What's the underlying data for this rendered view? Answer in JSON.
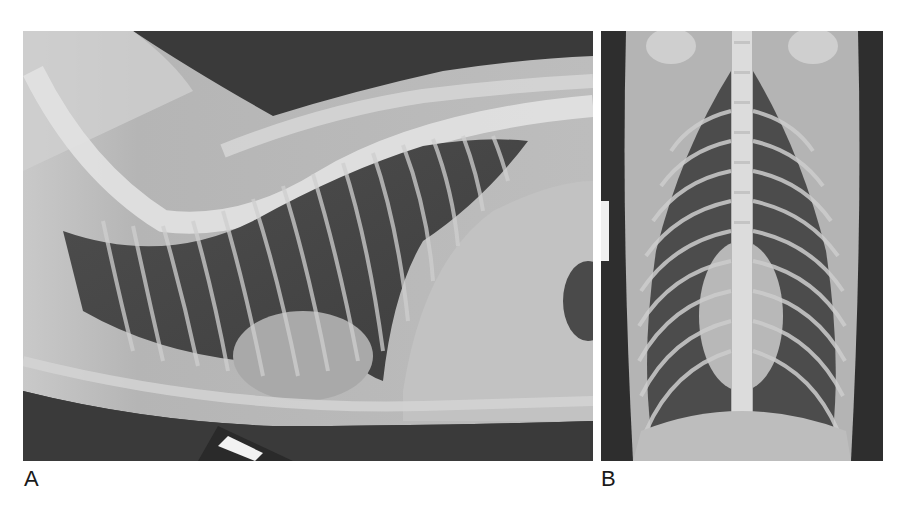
{
  "figure": {
    "panels": [
      {
        "label": "A",
        "view": "lateral thoracic radiograph",
        "description": "Lateral view of feline thorax showing spine, ribs, lungs and cardiac silhouette"
      },
      {
        "label": "B",
        "view": "ventrodorsal thoracic radiograph",
        "description": "Ventrodorsal view of feline thorax showing spine, rib cage and centered cardiac silhouette"
      }
    ],
    "colors": {
      "background": "#ffffff",
      "label_text": "#1a1a1a",
      "film_dark": "#2f2f2f",
      "lung_field": "#555555",
      "soft_tissue": "#a8a8a8",
      "bone": "#dcdcdc"
    }
  }
}
